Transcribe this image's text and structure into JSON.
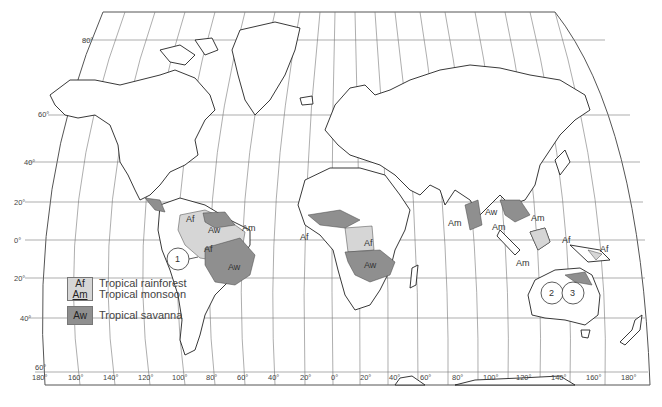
{
  "map": {
    "title": "Tropical climates (Köppen A group)",
    "colors": {
      "rainforest_monsoon": "#d6d6d6",
      "savanna": "#8f8f8f",
      "land_outline": "#222222",
      "graticule": "#666666"
    },
    "latitude_labels": [
      "80°",
      "60°",
      "40°",
      "20°",
      "0°",
      "20°",
      "40°",
      "60°"
    ],
    "longitude_labels": [
      "180°",
      "160°",
      "140°",
      "120°",
      "100°",
      "80°",
      "60°",
      "40°",
      "20°",
      "0°",
      "20°",
      "40°",
      "60°",
      "80°",
      "100°",
      "120°",
      "140°",
      "160°",
      "180°"
    ],
    "region_labels": {
      "central_america_af": "Af",
      "south_america_aw_north": "Aw",
      "south_america_am": "Am",
      "south_america_af": "Af",
      "south_america_aw_brazil": "Aw",
      "west_africa_af": "Af",
      "congo_af": "Af",
      "africa_aw": "Aw",
      "india_am": "Am",
      "se_asia_aw": "Aw",
      "se_asia_am_1": "Am",
      "philippines_am": "Am",
      "indonesia_am": "Am",
      "borneo_af": "Af",
      "new_guinea_af": "Af"
    },
    "markers": [
      "1",
      "2",
      "3"
    ]
  },
  "legend": {
    "items": [
      {
        "code_top": "Af",
        "code_bottom": "Am",
        "label_top": "Tropical rainforest",
        "label_bottom": "Tropical monsoon"
      },
      {
        "code": "Aw",
        "label": "Tropical savanna"
      }
    ]
  }
}
